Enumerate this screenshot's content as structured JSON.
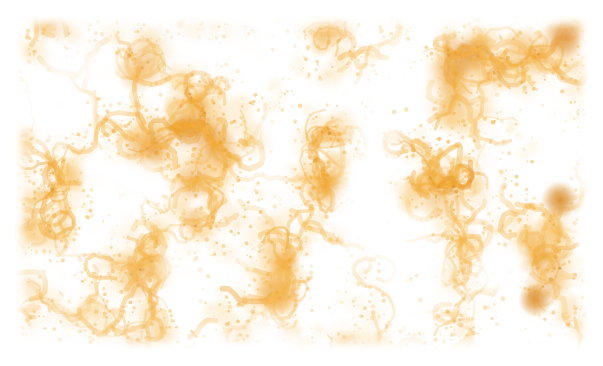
{
  "figure": {
    "kind": "photomicrograph",
    "caption": "",
    "alt_text": "Photomicrograph of tissue showing a dense reticular amber-brown stained network on a white background",
    "width_px": 603,
    "height_px": 366
  },
  "plate": {
    "left_px": 13,
    "top_px": 14,
    "width_px": 578,
    "height_px": 338,
    "margin_color": "#FFFFFF"
  },
  "palette": {
    "background": "#FFFFFF",
    "stain_light": "#FCE2A8",
    "stain_mid": "#F8C05A",
    "stain_strong": "#F2A427",
    "stain_dark": "#E08A20",
    "stain_deep": "#C9761A"
  },
  "appearance": {
    "pattern": "reticular mesh-like network",
    "stain_name": "amber / golden-brown chromogen",
    "counterstain": "none (white background)",
    "density_description": "dense interconnected strands with pale lacunae"
  },
  "features": [
    {
      "name": "dark-focus-upper-right",
      "cx_px": 566,
      "cy_px": 36,
      "r_px": 11,
      "color": "#DE861F"
    },
    {
      "name": "dark-focus-right-mid",
      "cx_px": 560,
      "cy_px": 200,
      "r_px": 9,
      "color": "#D9871F"
    },
    {
      "name": "dark-focus-right-lower",
      "cx_px": 535,
      "cy_px": 300,
      "r_px": 8,
      "color": "#D9871F"
    }
  ],
  "render": {
    "seed": 20240917,
    "blob_count": 1500,
    "fine_speck_count": 2600,
    "strand_count": 320
  }
}
